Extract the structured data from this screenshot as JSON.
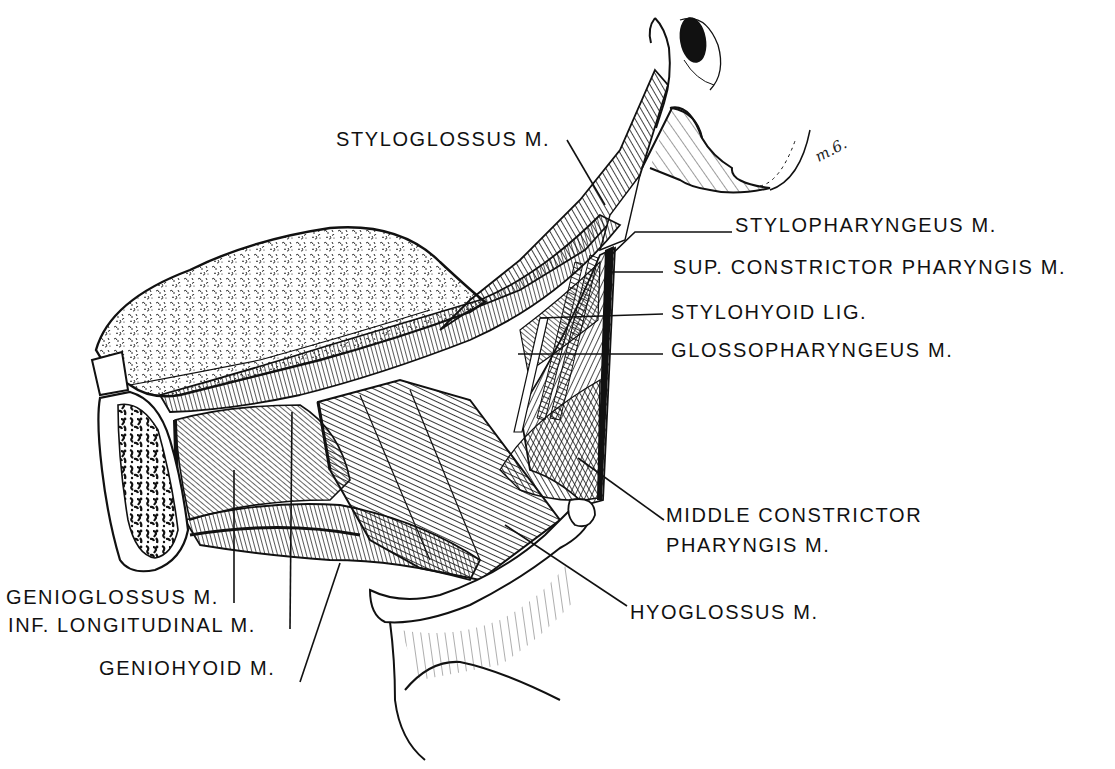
{
  "figure": {
    "style": "black-and-white pen-and-ink anatomical illustration",
    "colors": {
      "ink": "#111111",
      "paper": "#ffffff"
    },
    "signature": "m.6."
  },
  "labels": [
    {
      "id": "styloglossus",
      "text": "STYLOGLOSSUS M."
    },
    {
      "id": "stylopharyngeus",
      "text": "STYLOPHARYNGEUS M."
    },
    {
      "id": "sup-constrictor",
      "text": "SUP. CONSTRICTOR PHARYNGIS M."
    },
    {
      "id": "stylohyoid-lig",
      "text": "STYLOHYOID LIG."
    },
    {
      "id": "glossopharyngeus",
      "text": "GLOSSOPHARYNGEUS M."
    },
    {
      "id": "middle-constrictor-1",
      "text": "MIDDLE CONSTRICTOR"
    },
    {
      "id": "middle-constrictor-2",
      "text": "PHARYNGIS M."
    },
    {
      "id": "hyoglossus",
      "text": "HYOGLOSSUS M."
    },
    {
      "id": "genioglossus",
      "text": "GENIOGLOSSUS M."
    },
    {
      "id": "inf-longitudinal",
      "text": "INF. LONGITUDINAL M."
    },
    {
      "id": "geniohyoid",
      "text": "GENIOHYOID M."
    }
  ]
}
